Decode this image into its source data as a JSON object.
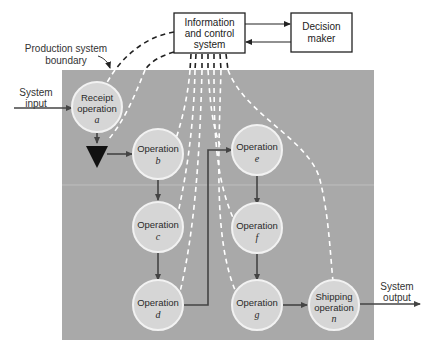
{
  "diagram": {
    "boundary_label_line1": "Production system",
    "boundary_label_line2": "boundary",
    "system_input_line1": "System",
    "system_input_line2": "input",
    "system_output_line1": "System",
    "system_output_line2": "output",
    "info_box": {
      "line1": "Information",
      "line2": "and control",
      "line3": "system"
    },
    "decision_box": {
      "line1": "Decision",
      "line2": "maker"
    },
    "nodes": {
      "a": {
        "line1": "Receipt",
        "line2": "operation",
        "id": "a"
      },
      "b": {
        "line1": "Operation",
        "id": "b"
      },
      "c": {
        "line1": "Operation",
        "id": "c"
      },
      "d": {
        "line1": "Operation",
        "id": "d"
      },
      "e": {
        "line1": "Operation",
        "id": "e"
      },
      "f": {
        "line1": "Operation",
        "id": "f"
      },
      "g": {
        "line1": "Operation",
        "id": "g"
      },
      "n": {
        "line1": "Shipping",
        "line2": "operation",
        "id": "n"
      }
    },
    "colors": {
      "panel": "#a9a9a9",
      "node_fill": "#d6d6d6",
      "node_stroke": "#f2f2f2",
      "arrow": "#444444",
      "dash": "#ffffff"
    }
  }
}
